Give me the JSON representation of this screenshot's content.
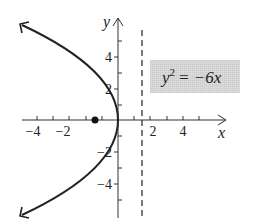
{
  "figure": {
    "equation": {
      "lhs": "y",
      "exp": "2",
      "rhs": "= −6x"
    },
    "axes": {
      "x_label": "x",
      "y_label": "y",
      "x_ticks": [
        {
          "value": -4,
          "label": "−4"
        },
        {
          "value": -2,
          "label": "−2"
        },
        {
          "value": 2,
          "label": "2"
        },
        {
          "value": 4,
          "label": "4"
        }
      ],
      "y_ticks": [
        {
          "value": 4,
          "label": "4"
        },
        {
          "value": 2,
          "label": "2"
        },
        {
          "value": -2,
          "label": "−2"
        },
        {
          "value": -4,
          "label": "−4"
        }
      ]
    },
    "focus": {
      "x": -1.5,
      "y": 0
    },
    "directrix": {
      "x": 1.5
    },
    "colors": {
      "curve": "#222222",
      "label_box": "#d6d6d6"
    }
  },
  "labels": {
    "x_m4": "−4",
    "x_m2": "−2",
    "x_2": "2",
    "x_4": "4",
    "y_4": "4",
    "y_2": "2",
    "y_m2": "−2",
    "y_m4": "−4",
    "x_axis": "x",
    "y_axis": "y",
    "eq_lhs": "y",
    "eq_exp": "2",
    "eq_rhs": "= −6x"
  }
}
